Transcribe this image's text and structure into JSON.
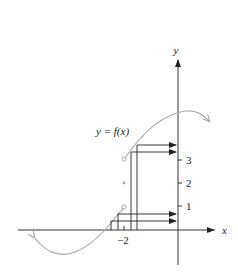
{
  "diagram": {
    "type": "function-graph",
    "function_label": "y = f(x)",
    "axes": {
      "x_label": "x",
      "y_label": "y",
      "x_ticks": [
        {
          "value": -2,
          "label": "−2"
        }
      ],
      "y_ticks": [
        {
          "value": 1,
          "label": "1"
        },
        {
          "value": 2,
          "label": "2"
        },
        {
          "value": 3,
          "label": "3"
        }
      ]
    },
    "discontinuity": {
      "x": -2,
      "open_points": [
        1,
        3
      ],
      "filled_point": 2
    },
    "arrows_to_y_axis": 4,
    "colors": {
      "curve": "#a8a8a8",
      "axes": "#333333",
      "construction_lines": "#222222"
    }
  }
}
